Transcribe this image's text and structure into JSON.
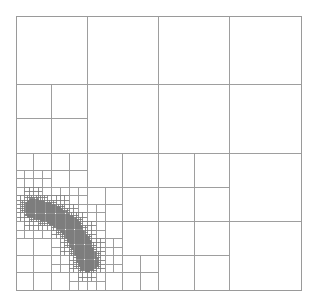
{
  "diagram": {
    "type": "quadtree-mesh",
    "background": "#ffffff",
    "line_color": "#9a9a9a",
    "fine_line_color": "#7a7a7a",
    "bounds": {
      "x0": 16,
      "y0": 16,
      "x1": 301,
      "y1": 290
    },
    "base_grid": {
      "cols": 4,
      "rows": 4
    },
    "max_depth": 6,
    "refinement_feature": {
      "description": "diagonal band of dense refinement in lower-left quadrant",
      "polyline": [
        [
          34,
          208
        ],
        [
          52,
          214
        ],
        [
          70,
          226
        ],
        [
          82,
          246
        ],
        [
          88,
          262
        ]
      ],
      "band_width": 7
    },
    "refinement_factor": 1.35,
    "extra_refined_cells": [
      {
        "col": 2,
        "row": 2,
        "depth": 1
      },
      {
        "col": 2,
        "row": 3,
        "depth": 1
      }
    ]
  }
}
